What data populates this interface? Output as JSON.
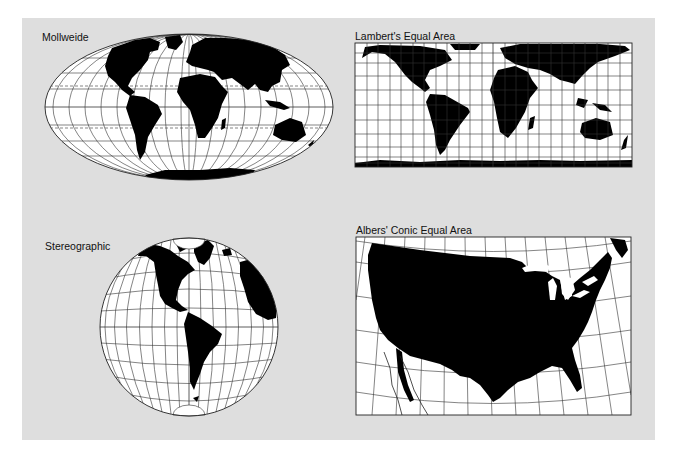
{
  "figure": {
    "background_color": "#dedede",
    "land_color": "#000000",
    "ocean_color": "#ffffff",
    "graticule_color": "#222222"
  },
  "maps": [
    {
      "id": "mollweide",
      "title": "Mollweide",
      "shape": "ellipse",
      "extent": "world"
    },
    {
      "id": "lambert",
      "title": "Lambert's Equal Area",
      "shape": "rectangle",
      "extent": "world"
    },
    {
      "id": "stereographic",
      "title": "Stereographic",
      "shape": "circle",
      "extent": "western hemisphere"
    },
    {
      "id": "albers",
      "title": "Albers' Conic Equal Area",
      "shape": "rectangle",
      "extent": "contiguous United States"
    }
  ]
}
